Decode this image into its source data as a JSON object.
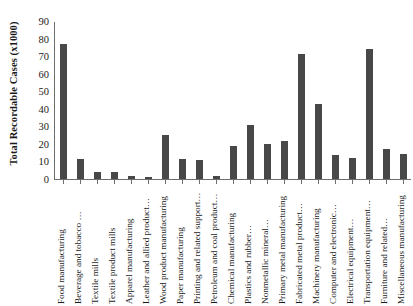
{
  "chart_data": {
    "type": "bar",
    "title": "",
    "xlabel": "",
    "ylabel": "Total Recordable Cases (x1000)",
    "ylim": [
      0,
      90
    ],
    "ytick_values": [
      0,
      10,
      20,
      30,
      40,
      50,
      60,
      70,
      80,
      90
    ],
    "ytick_labels": [
      "0",
      "10",
      "20",
      "30",
      "40",
      "50",
      "60",
      "70",
      "80",
      "90"
    ],
    "grid": false,
    "legend": false,
    "bar_color": "#484848",
    "axis_color": "#6e6e6e",
    "categories": [
      "Food manufacturing",
      "Beverage and tobacco …",
      "Textile mills",
      "Textile product mills",
      "Apparel manufacturing",
      "Leather and allied product…",
      "Wood product manufacturing",
      "Paper manufacturing",
      "Printing and related support…",
      "Petroleum and coal product…",
      "Chemical manufacturing",
      "Plastics and rubber…",
      "Nonmetallic mineral…",
      "Primary metal manufacturing",
      "Fabricated metal product…",
      "Machinery manufacturing",
      "Computer and electronic…",
      "Electrical equipment…",
      "Transportation equipment…",
      "Furniture and related…",
      "Miscellaneous manufacturing"
    ],
    "values": [
      77,
      11.5,
      4,
      4,
      2,
      1,
      25,
      11.5,
      11,
      2,
      19,
      31,
      20,
      21.5,
      71,
      43,
      13.5,
      12,
      74,
      17,
      14.5
    ]
  }
}
